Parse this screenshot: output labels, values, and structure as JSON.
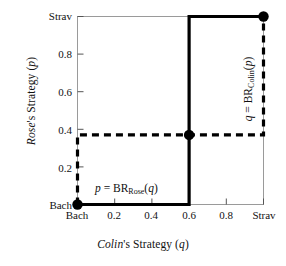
{
  "chart_data": {
    "type": "line",
    "title": "",
    "xlabel": "Colin's Strategy (q)",
    "ylabel": "Rose's Strategy (p)",
    "xlim": [
      0,
      1
    ],
    "ylim": [
      0,
      1
    ],
    "grid": false,
    "legend_position": "inline-annotations",
    "xticks": [
      {
        "value": 0.0,
        "label": "Bach"
      },
      {
        "value": 0.2,
        "label": "0.2"
      },
      {
        "value": 0.4,
        "label": "0.4"
      },
      {
        "value": 0.6,
        "label": "0.6"
      },
      {
        "value": 0.8,
        "label": "0.8"
      },
      {
        "value": 1.0,
        "label": "Strav"
      }
    ],
    "yticks": [
      {
        "value": 0.0,
        "label": "Bach"
      },
      {
        "value": 0.2,
        "label": "0.2"
      },
      {
        "value": 0.4,
        "label": "0.4"
      },
      {
        "value": 0.6,
        "label": "0.6"
      },
      {
        "value": 0.8,
        "label": "0.8"
      },
      {
        "value": 1.0,
        "label": "Strav"
      }
    ],
    "series": [
      {
        "name": "p = BR_Rose(q)",
        "label_plain": "p = BR",
        "label_sub": "Rose",
        "label_arg": "(q)",
        "style": "solid",
        "color": "#000000",
        "linewidth": 3,
        "points": [
          [
            0.0,
            0.0
          ],
          [
            0.6,
            0.0
          ],
          [
            0.6,
            1.0
          ],
          [
            1.0,
            1.0
          ]
        ]
      },
      {
        "name": "q = BR_Colin(p)",
        "label_plain": "q = BR",
        "label_sub": "Colin",
        "label_arg": "(p)",
        "style": "dashed",
        "color": "#000000",
        "linewidth": 3,
        "points": [
          [
            0.0,
            0.0
          ],
          [
            0.0,
            0.37
          ],
          [
            1.0,
            0.37
          ],
          [
            1.0,
            1.0
          ]
        ]
      }
    ],
    "markers": [
      {
        "name": "pure-equilibrium-bach-bach",
        "x": 0.0,
        "y": 0.0
      },
      {
        "name": "mixed-equilibrium",
        "x": 0.6,
        "y": 0.37
      },
      {
        "name": "pure-equilibrium-strav-strav",
        "x": 1.0,
        "y": 1.0
      }
    ]
  },
  "axis_labels": {
    "y": "Rose's Strategy (p)",
    "x": "Colin's Strategy (q)"
  },
  "ticks": {
    "y": [
      "Strav",
      "0.8",
      "0.6",
      "0.4",
      "0.2",
      "Bach"
    ],
    "x": [
      "Bach",
      "0.2",
      "0.4",
      "0.6",
      "0.8",
      "Strav"
    ]
  },
  "annotations": {
    "rose": "p = BRRose(q)",
    "colin": "q = BRColin(p)"
  }
}
